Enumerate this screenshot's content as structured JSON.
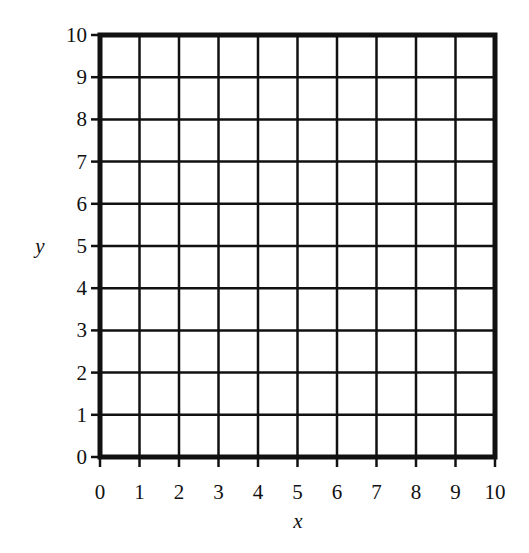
{
  "chart_data": {
    "type": "scatter",
    "title": "",
    "xlabel": "x",
    "ylabel": "y",
    "xlim": [
      0,
      10
    ],
    "ylim": [
      0,
      10
    ],
    "grid": true,
    "x_ticks": [
      "0",
      "1",
      "2",
      "3",
      "4",
      "5",
      "6",
      "7",
      "8",
      "9",
      "10"
    ],
    "y_ticks": [
      "0",
      "1",
      "2",
      "3",
      "4",
      "5",
      "6",
      "7",
      "8",
      "9",
      "10"
    ],
    "series": [],
    "note": "Blank coordinate grid with no plotted data"
  },
  "layout": {
    "plot_left": 100,
    "plot_right": 495,
    "plot_top": 35,
    "plot_bottom": 457,
    "line_color": "#111111",
    "grid_width": 2.5,
    "border_width": 5
  }
}
